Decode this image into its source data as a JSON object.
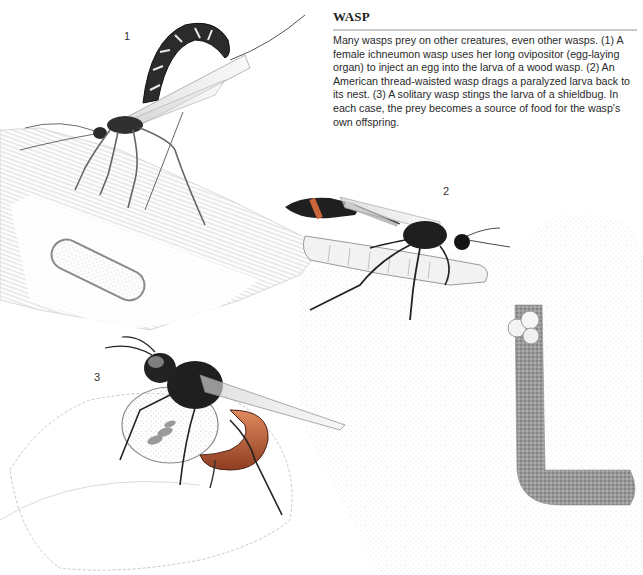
{
  "article": {
    "title": "WASP",
    "body": "Many wasps prey on other creatures, even other wasps. (1) A female ichneumon wasp uses her long ovipositor (egg-laying organ) to inject an egg into the larva of a wood wasp. (2) An American thread-waisted wasp drags a paralyzed larva back to its nest. (3) A solitary wasp stings the larva of a shieldbug. In each case, the prey becomes a source of food for the wasp's own offspring."
  },
  "illustrations": [
    {
      "label": "1",
      "subject": "female ichneumon wasp on wood with wood wasp larva in tunnel"
    },
    {
      "label": "2",
      "subject": "American thread-waisted wasp dragging paralyzed larva to burrow nest"
    },
    {
      "label": "3",
      "subject": "solitary wasp stinging shieldbug larva on leaf"
    }
  ],
  "colors": {
    "background": "#ffffff",
    "text": "#231f20",
    "rule": "#c9c9c9",
    "wasp_dark": "#1e1e1e",
    "wasp_orange": "#c9663a"
  }
}
